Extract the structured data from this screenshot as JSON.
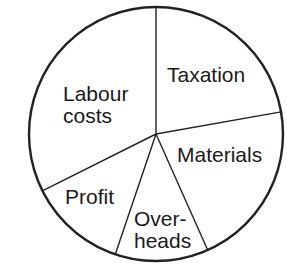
{
  "chart_data": {
    "type": "pie",
    "title": "",
    "start_angle_deg": 0,
    "direction": "clockwise",
    "slices": [
      {
        "label": "Taxation",
        "lines": [
          "Taxation"
        ],
        "value": 22,
        "angle_deg": 80
      },
      {
        "label": "Materials",
        "lines": [
          "Materials"
        ],
        "value": 21,
        "angle_deg": 76
      },
      {
        "label": "Overheads",
        "lines": [
          "Over-",
          "heads"
        ],
        "value": 12,
        "angle_deg": 42.7
      },
      {
        "label": "Profit",
        "lines": [
          "Profit"
        ],
        "value": 13,
        "angle_deg": 44.7
      },
      {
        "label": "Labour costs",
        "lines": [
          "Labour",
          "costs"
        ],
        "value": 32,
        "angle_deg": 116.6
      }
    ],
    "legend": "none",
    "labels_inside_slices": true
  },
  "style": {
    "stroke_color": "#222222",
    "fill_color": "#ffffff",
    "text_color": "#1a1a1a"
  },
  "layout": {
    "center": [
      156,
      134
    ],
    "radius": 127,
    "label_positions": {
      "Taxation": [
        [
          167,
          82
        ]
      ],
      "Materials": [
        [
          177,
          162
        ]
      ],
      "Overheads": [
        [
          134,
          226
        ],
        [
          134,
          248
        ]
      ],
      "Profit": [
        [
          65,
          204
        ]
      ],
      "Labour costs": [
        [
          63,
          101
        ],
        [
          63,
          123
        ]
      ]
    }
  }
}
